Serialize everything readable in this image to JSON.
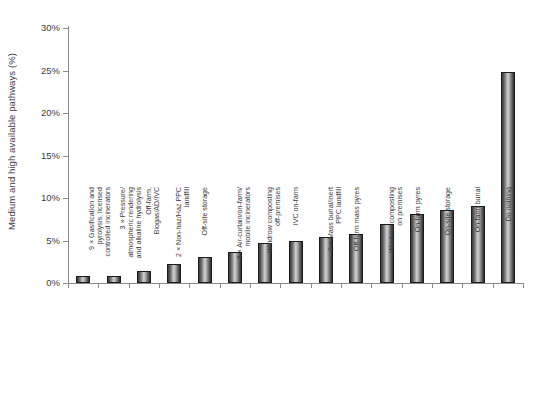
{
  "chart_data": {
    "type": "bar",
    "title": "",
    "subtitle": "",
    "xlabel": "",
    "ylabel": "Medium and high available pathways (%)",
    "ylim": [
      0,
      30
    ],
    "ytick_values": [
      0,
      5,
      10,
      15,
      20,
      25,
      30
    ],
    "ytick_labels": [
      "0%",
      "5%",
      "10%",
      "15%",
      "20%",
      "25%",
      "30%"
    ],
    "grid": false,
    "legend": null,
    "bar_style": {
      "fill": "vertical-gradient-grey",
      "edge_color": "#1a1a1a",
      "light_color": "#d2d2d2",
      "dark_color": "#2e2e2e"
    },
    "categories": [
      "9 × Gasification and pyrolysis, licensed controlled incinerators",
      "3 × Pressure/atmospheric rendering and alkaline hydrolysis",
      "Off-farm, Biogas/AD/IVC",
      "2 × Non-haz/Haz PPC landfill",
      "Off-site storage",
      "3 × Air-curtain/on-farm/mobile incinerators",
      "Windrow composting off-premises",
      "IVC on-farm",
      "2 × Mass burial/inert PPC landfill",
      "Off-farm mass pyres",
      "Windrow composting on premises",
      "On-farm pyres",
      "On-site storage",
      "On-farm burial",
      "Do nothing"
    ],
    "category_lines": [
      [
        "9 × Gasification and",
        "pyrolysis, licensed",
        "controlled incinerators"
      ],
      [
        "3 × Pressure/",
        "atmospheric rendering",
        "and alkaline hydrolysis"
      ],
      [
        "Off-farm,",
        "Biogas/AD/IVC"
      ],
      [
        "2 × Non-haz/Haz PPC",
        "landfill"
      ],
      [
        "Off-site storage"
      ],
      [
        "3 × Air-curtain/on-farm/",
        "mobile incinerators"
      ],
      [
        "Windrow composting",
        "off-premises"
      ],
      [
        "IVC on-farm"
      ],
      [
        "2 × Mass burial/inert",
        "PPC landfill"
      ],
      [
        "Off-farm mass pyres"
      ],
      [
        "Windrow composting",
        "on premises"
      ],
      [
        "On-farm pyres"
      ],
      [
        "On-site storage"
      ],
      [
        "On-farm burial"
      ],
      [
        "Do nothing"
      ]
    ],
    "values": [
      0.8,
      0.8,
      1.4,
      2.2,
      3.1,
      3.6,
      4.7,
      4.9,
      5.4,
      5.8,
      6.9,
      8.1,
      8.6,
      9.1,
      24.8
    ]
  }
}
